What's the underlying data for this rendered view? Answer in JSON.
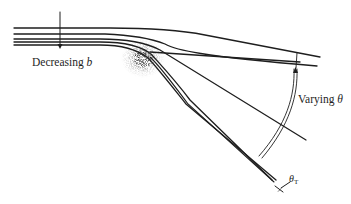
{
  "figure": {
    "type": "scattering-trajectory-diagram",
    "labels": {
      "decreasing_prefix": "Decreasing ",
      "decreasing_var": "b",
      "varying_prefix": "Varying ",
      "varying_var": "θ",
      "theta_t_var": "θ",
      "theta_t_sub": "T"
    },
    "colors": {
      "line": "#1e1e1e",
      "background": "#ffffff",
      "scatter_center": "#2a2a2a"
    }
  }
}
